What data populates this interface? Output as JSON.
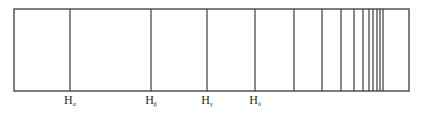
{
  "diagram": {
    "box": {
      "left": 14,
      "right": 409,
      "top": 9,
      "bottom": 91
    },
    "line_color": "#3a3a3a",
    "line_positions": [
      70,
      151,
      207,
      255,
      294,
      322,
      341,
      354,
      363,
      369,
      373,
      377,
      380,
      383
    ],
    "labels": [
      {
        "base": "H",
        "sub": "α",
        "x": 70
      },
      {
        "base": "H",
        "sub": "β",
        "x": 151
      },
      {
        "base": "H",
        "sub": "γ",
        "x": 207
      },
      {
        "base": "H",
        "sub": "δ",
        "x": 255
      }
    ]
  }
}
